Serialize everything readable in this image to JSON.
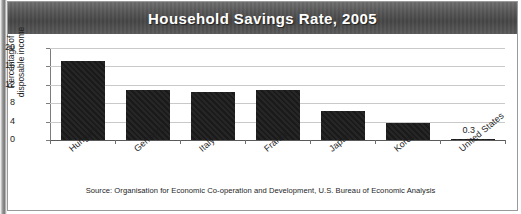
{
  "figure": {
    "title": "Household Savings Rate, 2005",
    "source_note": "Source: Organisation for Economic Co-operation and Development, U.S. Bureau of Economic Analysis",
    "y_axis_title_line1": "Percentage of",
    "y_axis_title_line2": "disposable income",
    "colors": {
      "title_bar": "#565656",
      "title_text": "#ffffff",
      "bar": "#1a1a1a",
      "gridline": "#c9c9c9",
      "axis": "#5a5a5a",
      "background": "#ffffff"
    }
  },
  "chart_data": {
    "type": "bar",
    "title": "Household Savings Rate, 2005",
    "xlabel": "",
    "ylabel": "Percentage of disposable income",
    "ylim": [
      0,
      20
    ],
    "yticks": [
      0,
      4,
      8,
      12,
      16,
      20
    ],
    "ytick_labels": [
      "0",
      "4",
      "8",
      "12",
      "16",
      "20"
    ],
    "grid": true,
    "legend": false,
    "categories": [
      "Hungary",
      "Germany",
      "Italy",
      "France",
      "Japan",
      "Korea",
      "United States"
    ],
    "values": [
      17.1,
      10.8,
      10.5,
      10.8,
      6.4,
      3.7,
      0.3
    ],
    "data_labels": [
      {
        "category": "United States",
        "text": "0.3"
      }
    ]
  }
}
